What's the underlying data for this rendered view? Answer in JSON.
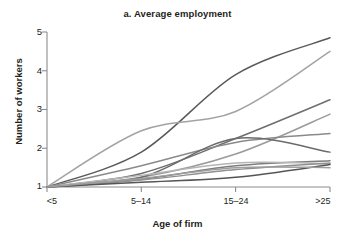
{
  "chart_data": {
    "type": "line",
    "title": "a. Average employment",
    "xlabel": "Age of firm",
    "ylabel": "Number of workers",
    "categories": [
      "<5",
      "5–14",
      "15–24",
      ">25"
    ],
    "x": [
      0,
      1,
      2,
      3
    ],
    "ylim": [
      1,
      5
    ],
    "yticks": [
      1,
      2,
      3,
      4,
      5
    ],
    "ytick_labels": [
      "1",
      "2",
      "3",
      "4",
      "5"
    ],
    "grid": false,
    "legend": "none",
    "series": [
      {
        "name": "series-1",
        "color": "#595959",
        "values": [
          1.0,
          1.9,
          3.9,
          4.85
        ]
      },
      {
        "name": "series-2",
        "color": "#a3a3a3",
        "values": [
          1.0,
          2.45,
          2.95,
          4.5
        ]
      },
      {
        "name": "series-3",
        "color": "#6e6e6e",
        "values": [
          1.0,
          1.35,
          2.25,
          3.25
        ]
      },
      {
        "name": "series-4",
        "color": "#9a9a9a",
        "values": [
          1.0,
          1.25,
          1.85,
          2.88
        ]
      },
      {
        "name": "series-5",
        "color": "#8a8a8a",
        "values": [
          1.0,
          1.55,
          2.15,
          2.38
        ]
      },
      {
        "name": "series-6",
        "color": "#6b6b6b",
        "values": [
          1.0,
          1.25,
          2.25,
          1.9
        ]
      },
      {
        "name": "series-7",
        "color": "#7d7d7d",
        "values": [
          1.0,
          1.2,
          1.55,
          1.68
        ]
      },
      {
        "name": "series-8",
        "color": "#b5b5b5",
        "values": [
          1.0,
          1.3,
          1.62,
          1.6
        ]
      },
      {
        "name": "series-9",
        "color": "#909090",
        "values": [
          1.0,
          1.18,
          1.45,
          1.62
        ]
      },
      {
        "name": "series-10",
        "color": "#555555",
        "values": [
          1.0,
          1.12,
          1.25,
          1.58
        ]
      },
      {
        "name": "series-11",
        "color": "#9e9e9e",
        "values": [
          1.0,
          1.22,
          1.5,
          1.5
        ]
      }
    ]
  },
  "axis": {
    "axis_color": "#8c8c8c",
    "text_color": "#231f20"
  }
}
